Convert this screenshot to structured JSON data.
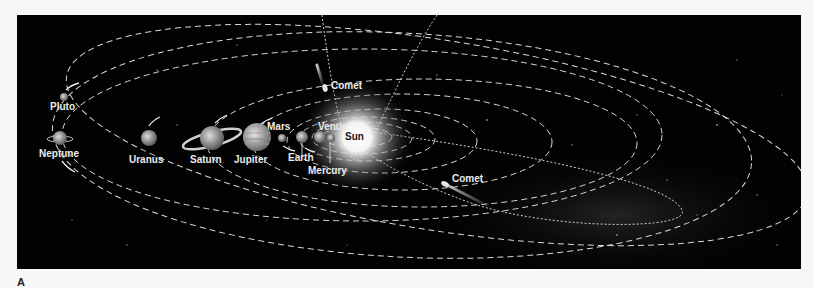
{
  "figure": {
    "label": "A",
    "background_color": "#020202",
    "page_color": "#f7f7f7"
  },
  "labels": {
    "sun": "Sun",
    "mercury": "Mercury",
    "venus": "Venus",
    "earth": "Earth",
    "mars": "Mars",
    "jupiter": "Jupiter",
    "saturn": "Saturn",
    "uranus": "Uranus",
    "neptune": "Neptune",
    "pluto": "Pluto",
    "comet_top": "Comet",
    "comet_bottom": "Comet"
  },
  "bodies": [
    {
      "name": "Sun",
      "icon": "sun-icon"
    },
    {
      "name": "Mercury",
      "icon": "planet-icon"
    },
    {
      "name": "Venus",
      "icon": "planet-icon"
    },
    {
      "name": "Earth",
      "icon": "planet-icon"
    },
    {
      "name": "Mars",
      "icon": "planet-icon"
    },
    {
      "name": "Jupiter",
      "icon": "planet-icon"
    },
    {
      "name": "Saturn",
      "icon": "ringed-planet-icon"
    },
    {
      "name": "Uranus",
      "icon": "planet-icon"
    },
    {
      "name": "Neptune",
      "icon": "planet-icon"
    },
    {
      "name": "Pluto",
      "icon": "planet-icon"
    }
  ],
  "comets": [
    {
      "label": "Comet",
      "position": "upper"
    },
    {
      "label": "Comet",
      "position": "lower-right"
    }
  ]
}
